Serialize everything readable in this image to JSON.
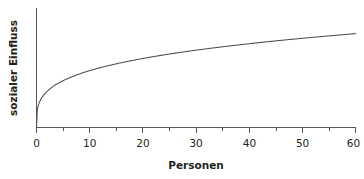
{
  "chart_data": {
    "type": "line",
    "title": "",
    "xlabel": "Personen",
    "ylabel": "sozialer Einfluss",
    "xlim": [
      0,
      60
    ],
    "ylim": [
      0,
      1.05
    ],
    "grid": false,
    "legend": null,
    "x_ticks": [
      0,
      10,
      20,
      30,
      40,
      50,
      60
    ],
    "x_tick_labels": [
      "0",
      "10",
      "20",
      "30",
      "40",
      "50",
      "60"
    ],
    "x_minor_ticks": [
      5,
      15,
      25,
      35,
      45,
      55
    ],
    "y_ticks": [],
    "y_tick_labels": [],
    "series": [
      {
        "name": "sozialer Einfluss",
        "color": "#4d4d4f",
        "x": [
          0,
          0.5,
          1,
          2,
          3,
          4,
          5,
          6,
          8,
          10,
          12,
          14,
          16,
          18,
          20,
          24,
          28,
          32,
          36,
          40,
          44,
          48,
          52,
          56,
          60
        ],
        "y": [
          0.0,
          0.243,
          0.295,
          0.358,
          0.4,
          0.434,
          0.461,
          0.484,
          0.522,
          0.553,
          0.579,
          0.601,
          0.621,
          0.639,
          0.655,
          0.684,
          0.708,
          0.729,
          0.748,
          0.765,
          0.781,
          0.795,
          0.808,
          0.82,
          0.832
        ]
      }
    ]
  },
  "axes": {
    "x_label": "Personen",
    "y_label": "sozialer Einfluss",
    "x_tick_labels": [
      "0",
      "10",
      "20",
      "30",
      "40",
      "50",
      "60"
    ]
  },
  "style": {
    "axis_color": "#58595b",
    "curve_color": "#4d4d4f",
    "text_color": "#231f20",
    "background": "#ffffff"
  }
}
